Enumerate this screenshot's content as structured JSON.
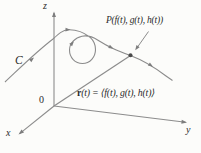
{
  "figure": {
    "colors": {
      "background": "#fcfcfa",
      "stroke": "#8c8c8c",
      "arrowhead": "#7d7d7d",
      "point": "#4a4a4a",
      "text": "#2b2b2b"
    },
    "labels": {
      "z_axis": "z",
      "y_axis": "y",
      "x_axis": "x",
      "origin": "0",
      "curve": "C",
      "point": "P(f(t), g(t), h(t))",
      "vector_bold": "r",
      "vector_rest": "(t) = ⟨f(t), g(t), h(t)⟩"
    }
  }
}
